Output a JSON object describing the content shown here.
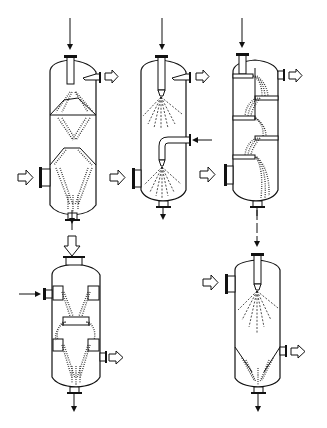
{
  "figure": {
    "background": "#ffffff",
    "line_color": "#111111"
  },
  "vessels": [
    {
      "id": "a",
      "type": "baffle-cone contactor",
      "position": "top-left"
    },
    {
      "id": "b",
      "type": "two-stage spray tower",
      "position": "top-middle"
    },
    {
      "id": "c",
      "type": "cascade tray column",
      "position": "top-right"
    },
    {
      "id": "d",
      "type": "trough/weir contactor",
      "position": "bottom-left"
    },
    {
      "id": "e",
      "type": "single spray tower with conical collector",
      "position": "bottom-right"
    }
  ],
  "flow_symbols": {
    "liquid": "thin-arrow",
    "gas": "hollow-arrow"
  }
}
